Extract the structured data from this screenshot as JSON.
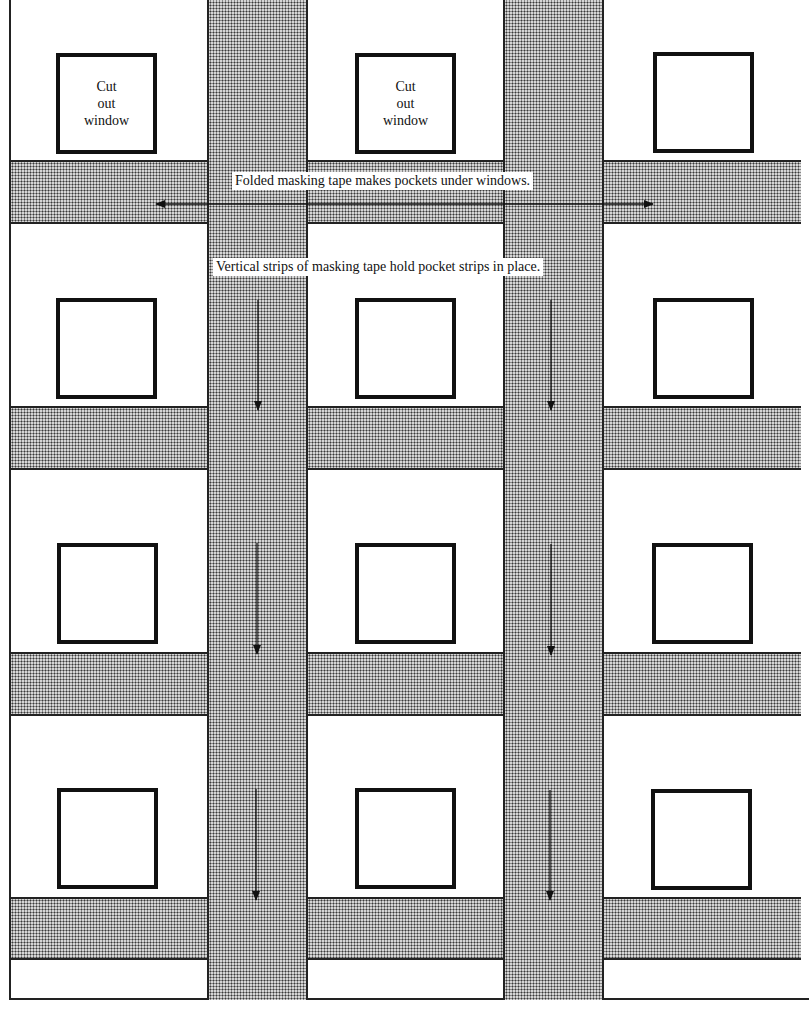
{
  "diagram": {
    "title_labels": {
      "horizontal_note": "Folded masking tape makes pockets under windows.",
      "vertical_note": "Vertical strips of masking tape hold pocket strips in place."
    },
    "window_label_lines": [
      "Cut",
      "out",
      "window"
    ],
    "grid": {
      "columns": 3,
      "rows": 4,
      "labeled_windows": [
        {
          "row": 1,
          "column": 1,
          "label": "Cut out window"
        },
        {
          "row": 1,
          "column": 2,
          "label": "Cut out window"
        }
      ]
    },
    "elements": {
      "horizontal_pocket_strips": 4,
      "vertical_holding_strips": 2,
      "windows": 12
    },
    "colors": {
      "line": "#111111",
      "tape_fill": "#d6d6d6",
      "tape_dots": "#3a3a3a",
      "background": "#ffffff"
    }
  }
}
